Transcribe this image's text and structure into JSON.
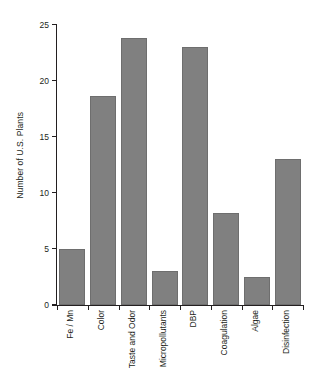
{
  "chart_data": {
    "type": "bar",
    "title": "",
    "xlabel": "",
    "ylabel": "Number of U.S. Plants",
    "categories": [
      "Fe / Mn",
      "Color",
      "Taste and Odor",
      "Micropollutants",
      "DBP",
      "Coagulation",
      "Algae",
      "Disinfection"
    ],
    "values": [
      5,
      18.7,
      23.8,
      3,
      23,
      8.2,
      2.5,
      13
    ],
    "ylim": [
      0,
      25
    ],
    "yticks": [
      0,
      5,
      10,
      15,
      20,
      25
    ],
    "ytick_labels": [
      "0",
      "5",
      "10",
      "15",
      "20",
      "25"
    ],
    "grid": false,
    "legend": null,
    "bar_color": "#808080",
    "bar_edge_color": "#6e6e6e",
    "axis_color": "#231f20"
  }
}
